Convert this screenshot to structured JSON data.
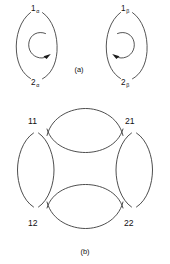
{
  "figure": {
    "background_color": "#ffffff",
    "line_color": "#2a2a2a",
    "parts": [
      {
        "caption": "(a)",
        "caption_x": 79,
        "caption_y": 72,
        "loops": [
          {
            "name": "alpha-loop",
            "top_label": "1",
            "top_label_sub": "α",
            "bottom_label": "2",
            "bottom_label_sub": "α",
            "arrow_direction": "clockwise",
            "inner_arc_opening": "right"
          },
          {
            "name": "beta-loop",
            "top_label": "1",
            "top_label_sub": "β",
            "bottom_label": "2",
            "bottom_label_sub": "β",
            "arrow_direction": "counterclockwise",
            "inner_arc_opening": "left"
          }
        ]
      },
      {
        "caption": "(b)",
        "caption_x": 84,
        "caption_y": 254,
        "lenses": [
          {
            "name": "top-lens",
            "orientation": "horizontal"
          },
          {
            "name": "bottom-lens",
            "orientation": "horizontal"
          },
          {
            "name": "left-lens",
            "orientation": "vertical"
          },
          {
            "name": "right-lens",
            "orientation": "vertical"
          }
        ],
        "corner_labels": [
          {
            "name": "label-11",
            "text": "11",
            "x": 28,
            "y": 124
          },
          {
            "name": "label-21",
            "text": "21",
            "x": 125,
            "y": 124
          },
          {
            "name": "label-12",
            "text": "12",
            "x": 28,
            "y": 226
          },
          {
            "name": "label-22",
            "text": "22",
            "x": 124,
            "y": 226
          }
        ]
      }
    ]
  }
}
